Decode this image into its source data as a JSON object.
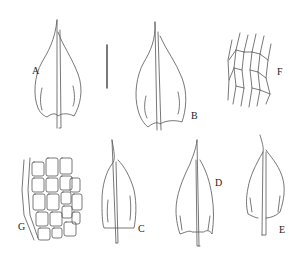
{
  "figure": {
    "panels": [
      {
        "id": "A",
        "label": "A",
        "type": "leaf",
        "x": 32,
        "y": 66
      },
      {
        "id": "B",
        "label": "B",
        "type": "leaf",
        "x": 191,
        "y": 111
      },
      {
        "id": "C",
        "label": "C",
        "type": "leaf",
        "x": 138,
        "y": 224
      },
      {
        "id": "D",
        "label": "D",
        "type": "leaf",
        "x": 215,
        "y": 178
      },
      {
        "id": "E",
        "label": "E",
        "type": "leaf",
        "x": 279,
        "y": 225
      },
      {
        "id": "F",
        "label": "F",
        "type": "upper-leaf-cells",
        "x": 277,
        "y": 67
      },
      {
        "id": "G",
        "label": "G",
        "type": "basal-leaf-cells",
        "x": 18,
        "y": 222
      }
    ],
    "scale_bar": {
      "x": 107,
      "y1": 45,
      "y2": 88
    }
  },
  "colors": {
    "ink": "#444444",
    "background": "#ffffff"
  }
}
